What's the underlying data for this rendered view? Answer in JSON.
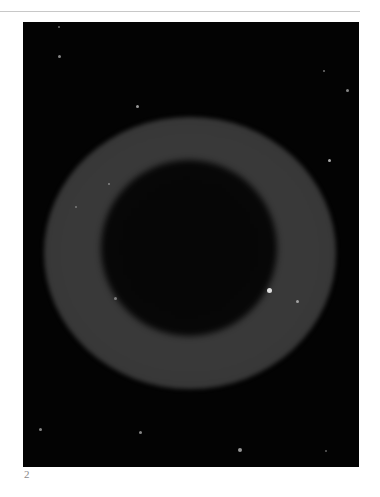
{
  "figure": {
    "label": "2",
    "colors": {
      "background": "#030303",
      "ring": "#3a3a3a",
      "center": "#060606",
      "stars": "#bdbdbd"
    }
  }
}
